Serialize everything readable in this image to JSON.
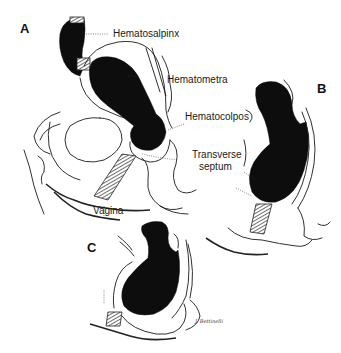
{
  "figure": {
    "panels": [
      {
        "id": "A",
        "letter": "A"
      },
      {
        "id": "B",
        "letter": "B"
      },
      {
        "id": "C",
        "letter": "C"
      }
    ],
    "labels": {
      "hematosalpinx": "Hematosalpinx",
      "hematometra": "Hematometra",
      "hematocolpos": "Hematocolpos",
      "transverse_septum_line1": "Transverse",
      "transverse_septum_line2": "septum",
      "vagina": "Vagina"
    },
    "signature": "J. Bettinelli",
    "colors": {
      "ink": "#1a1a1a",
      "blood_fill": "#0d0d0d",
      "background": "#ffffff"
    }
  }
}
